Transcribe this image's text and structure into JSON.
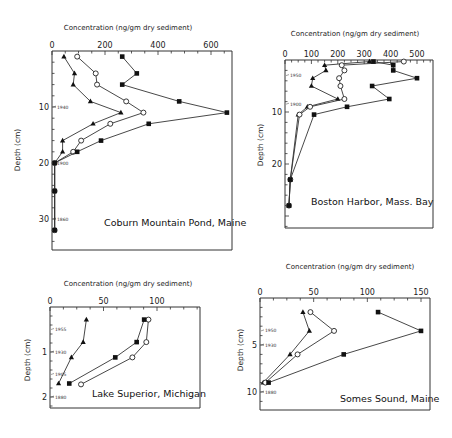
{
  "chart_data": [
    {
      "type": "line",
      "title": "Coburn Mountain Pond, Maine",
      "xlabel": "Concentration (ng/gm dry sediment)",
      "ylabel": "Depth (cm)",
      "xlim": [
        0,
        650
      ],
      "ylim": [
        35,
        0
      ],
      "x_ticks": [
        0,
        200,
        400,
        600
      ],
      "y_ticks": [
        10,
        20,
        30
      ],
      "date_markers": [
        {
          "depth": 10,
          "label": "1940"
        },
        {
          "depth": 20,
          "label": "1900"
        },
        {
          "depth": 30,
          "label": "1860"
        }
      ],
      "series": [
        {
          "name": "triangle",
          "marker": "filled-triangle",
          "points": [
            [
              45,
              1
            ],
            [
              85,
              4
            ],
            [
              80,
              6
            ],
            [
              145,
              9
            ],
            [
              260,
              11
            ],
            [
              155,
              13
            ],
            [
              40,
              16
            ],
            [
              40,
              18
            ],
            [
              10,
              20
            ],
            [
              10,
              25
            ],
            [
              10,
              32
            ]
          ]
        },
        {
          "name": "circle",
          "marker": "open-circle",
          "points": [
            [
              95,
              1
            ],
            [
              165,
              4
            ],
            [
              170,
              6
            ],
            [
              280,
              9
            ],
            [
              345,
              11
            ],
            [
              220,
              13
            ],
            [
              110,
              16
            ],
            [
              80,
              18
            ],
            [
              10,
              20
            ],
            [
              10,
              25
            ],
            [
              10,
              32
            ]
          ]
        },
        {
          "name": "square",
          "marker": "filled-square",
          "points": [
            [
              265,
              1
            ],
            [
              320,
              4
            ],
            [
              265,
              6
            ],
            [
              480,
              9
            ],
            [
              660,
              11
            ],
            [
              365,
              13
            ],
            [
              185,
              16
            ],
            [
              95,
              18
            ],
            [
              10,
              20
            ],
            [
              10,
              25
            ],
            [
              10,
              32
            ]
          ]
        }
      ]
    },
    {
      "type": "line",
      "title": "Boston Harbor, Mass. Bay",
      "xlabel": "Concentration (ng/gm dry sediment)",
      "ylabel": "Depth (cm)",
      "xlim": [
        0,
        550
      ],
      "ylim": [
        30,
        0
      ],
      "x_ticks": [
        0,
        100,
        200,
        300,
        400,
        500
      ],
      "y_ticks": [
        10,
        20
      ],
      "date_markers": [
        {
          "depth": 3,
          "label": "1950"
        },
        {
          "depth": 8.5,
          "label": "1900"
        }
      ],
      "series": [
        {
          "name": "triangle",
          "marker": "filled-triangle",
          "points": [
            [
              320,
              0.3
            ],
            [
              150,
              1
            ],
            [
              155,
              2
            ],
            [
              105,
              3.5
            ],
            [
              100,
              5
            ],
            [
              200,
              7.5
            ],
            [
              85,
              9
            ],
            [
              50,
              10.5
            ],
            [
              20,
              23
            ],
            [
              15,
              28
            ]
          ]
        },
        {
          "name": "circle",
          "marker": "open-circle",
          "points": [
            [
              450,
              0.3
            ],
            [
              215,
              1
            ],
            [
              225,
              2
            ],
            [
              205,
              3.5
            ],
            [
              210,
              5
            ],
            [
              225,
              7.5
            ],
            [
              95,
              9
            ],
            [
              55,
              10.5
            ],
            [
              20,
              23
            ],
            [
              15,
              28
            ]
          ]
        },
        {
          "name": "square",
          "marker": "filled-square",
          "points": [
            [
              335,
              0.3
            ],
            [
              410,
              1
            ],
            [
              410,
              2
            ],
            [
              500,
              3.5
            ],
            [
              330,
              5
            ],
            [
              395,
              7.5
            ],
            [
              235,
              9
            ],
            [
              110,
              10.5
            ],
            [
              20,
              23
            ],
            [
              15,
              28
            ]
          ]
        }
      ]
    },
    {
      "type": "line",
      "title": "Lake Superior, Michigan",
      "xlabel": "Concentration (ng/gm dry sediment)",
      "ylabel": "Depth (cm)",
      "xlim": [
        0,
        140
      ],
      "ylim": [
        2.2,
        0
      ],
      "x_ticks": [
        0,
        50,
        100
      ],
      "y_ticks": [
        1,
        2
      ],
      "date_markers": [
        {
          "depth": 0.5,
          "label": "1955"
        },
        {
          "depth": 1.0,
          "label": "1930"
        },
        {
          "depth": 1.5,
          "label": "1905"
        },
        {
          "depth": 2.0,
          "label": "1880"
        }
      ],
      "series": [
        {
          "name": "triangle",
          "marker": "filled-triangle",
          "points": [
            [
              34,
              0.28
            ],
            [
              31,
              0.78
            ],
            [
              20,
              1.12
            ],
            [
              8,
              1.7
            ]
          ]
        },
        {
          "name": "circle",
          "marker": "open-circle",
          "points": [
            [
              92,
              0.28
            ],
            [
              90,
              0.78
            ],
            [
              77,
              1.12
            ],
            [
              29,
              1.72
            ]
          ]
        },
        {
          "name": "square",
          "marker": "filled-square",
          "points": [
            [
              88,
              0.28
            ],
            [
              81,
              0.78
            ],
            [
              61,
              1.12
            ],
            [
              18,
              1.7
            ]
          ]
        }
      ]
    },
    {
      "type": "line",
      "title": "Somes Sound, Maine",
      "xlabel": "Concentration (ng/gm dry sediment)",
      "ylabel": "Depth (cm)",
      "xlim": [
        0,
        160
      ],
      "ylim": [
        11,
        0
      ],
      "x_ticks": [
        0,
        50,
        100,
        150
      ],
      "y_ticks": [
        5,
        10
      ],
      "date_markers": [
        {
          "depth": 3.5,
          "label": "1950"
        },
        {
          "depth": 5,
          "label": "1930"
        },
        {
          "depth": 10,
          "label": "1880"
        }
      ],
      "series": [
        {
          "name": "triangle",
          "marker": "filled-triangle",
          "points": [
            [
              40,
              1.5
            ],
            [
              46,
              3.5
            ],
            [
              28,
              6
            ],
            [
              3,
              9
            ]
          ]
        },
        {
          "name": "circle",
          "marker": "open-circle",
          "points": [
            [
              47,
              1.5
            ],
            [
              69,
              3.5
            ],
            [
              35,
              6
            ],
            [
              5,
              9
            ]
          ]
        },
        {
          "name": "square",
          "marker": "filled-square",
          "points": [
            [
              110,
              1.5
            ],
            [
              150,
              3.5
            ],
            [
              78,
              6
            ],
            [
              8,
              9
            ]
          ]
        }
      ]
    }
  ],
  "labels": {
    "xlabel": "Concentration (ng/gm dry sediment)",
    "ylabel": "Depth (cm)"
  }
}
